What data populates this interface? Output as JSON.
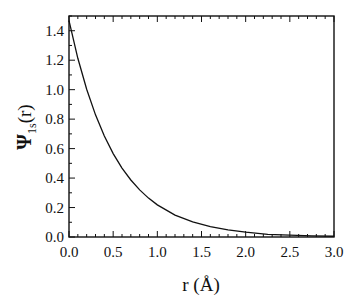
{
  "chart_data": {
    "type": "line",
    "title": "",
    "xlabel": "r (Å)",
    "ylabel": "Ψ1s(r)",
    "ylabel_parts": {
      "main": "Ψ",
      "sub": "1s",
      "arg": "(r)"
    },
    "xlim": [
      0.0,
      3.0
    ],
    "ylim": [
      0.0,
      1.5
    ],
    "grid": false,
    "legend": null,
    "x_ticks": [
      "0.0",
      "0.5",
      "1.0",
      "1.5",
      "2.0",
      "2.5",
      "3.0"
    ],
    "y_ticks": [
      "0.0",
      "0.2",
      "0.4",
      "0.6",
      "0.8",
      "1.0",
      "1.2",
      "1.4"
    ],
    "series": [
      {
        "name": "Psi_1s(r)",
        "color": "#111111",
        "x": [
          0.0,
          0.1,
          0.2,
          0.3,
          0.4,
          0.5,
          0.6,
          0.7,
          0.8,
          0.9,
          1.0,
          1.2,
          1.4,
          1.6,
          1.8,
          2.0,
          2.25,
          2.5,
          2.75,
          3.0
        ],
        "values": [
          1.468,
          1.213,
          1.003,
          0.829,
          0.685,
          0.566,
          0.468,
          0.387,
          0.32,
          0.264,
          0.218,
          0.149,
          0.102,
          0.07,
          0.048,
          0.033,
          0.018,
          0.013,
          0.008,
          0.005
        ]
      }
    ]
  }
}
